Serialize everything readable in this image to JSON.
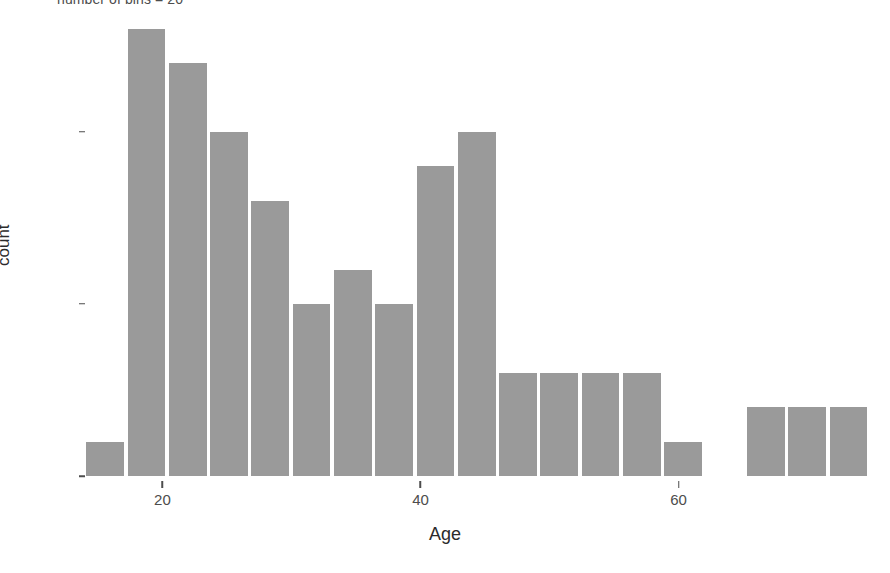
{
  "chart_data": {
    "type": "bar",
    "title": "number of bins = 20",
    "xlabel": "Age",
    "ylabel": "count",
    "grid": false,
    "legend": null,
    "xlim": [
      14,
      76
    ],
    "ylim": [
      0,
      13.6
    ],
    "x_ticks": [
      20,
      40,
      60
    ],
    "x_tick_labels": [
      "20",
      "40",
      "60"
    ],
    "y_ticks": [
      0,
      5,
      10
    ],
    "y_tick_labels": [
      "0",
      "5",
      "10"
    ],
    "bin_width": 3.2,
    "bar_color": "#9a9a9a",
    "bin_centers": [
      15.7,
      18.9,
      22.1,
      25.3,
      28.5,
      31.7,
      34.9,
      38.1,
      41.3,
      44.5,
      47.7,
      50.9,
      54.1,
      57.3,
      60.5,
      63.7,
      66.9,
      70.1,
      73.3
    ],
    "bin_starts": [
      14.1,
      17.3,
      20.5,
      23.7,
      26.9,
      30.1,
      33.3,
      36.5,
      39.7,
      42.9,
      46.1,
      49.3,
      52.5,
      55.7,
      58.9,
      62.1,
      65.3,
      68.5,
      71.7
    ],
    "categories": [
      "14.1-17.3",
      "17.3-20.5",
      "20.5-23.7",
      "23.7-26.9",
      "26.9-30.1",
      "30.1-33.3",
      "33.3-36.5",
      "36.5-39.7",
      "39.7-42.9",
      "42.9-46.1",
      "46.1-49.3",
      "49.3-52.5",
      "52.5-55.7",
      "55.7-58.9",
      "58.9-62.1",
      "62.1-65.3",
      "65.3-68.5",
      "68.5-71.7",
      "71.7-74.9"
    ],
    "values": [
      1,
      13,
      12,
      10,
      8,
      5,
      6,
      5,
      9,
      10,
      3,
      3,
      3,
      3,
      1,
      0,
      2,
      2,
      2
    ]
  }
}
